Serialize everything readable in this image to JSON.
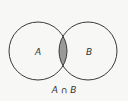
{
  "diagram": {
    "type": "venn",
    "sets": [
      {
        "label": "A",
        "cx": 38,
        "cy": 51,
        "r": 29
      },
      {
        "label": "B",
        "cx": 88,
        "cy": 51,
        "r": 29
      }
    ],
    "caption": "A ∩ B",
    "colors": {
      "stroke": "#3a3a3a",
      "fill_intersection": "#9a9a9a",
      "background": "#f7f7f5"
    }
  }
}
